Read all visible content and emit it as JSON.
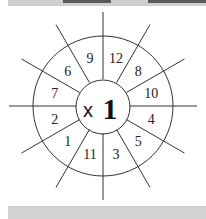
{
  "worksheet": {
    "operator": "x",
    "multiplier": "1",
    "segments_clockwise_from_top": [
      "12",
      "8",
      "10",
      "4",
      "5",
      "3",
      "11",
      "1",
      "2",
      "7",
      "6",
      "9"
    ]
  },
  "colors": {
    "line": "#333333",
    "bar": "#d0d0d0",
    "bar_dark": "#5a5a5a"
  }
}
